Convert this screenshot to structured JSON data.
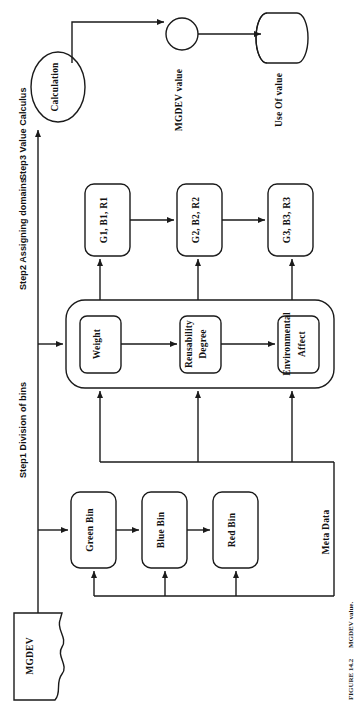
{
  "figure": {
    "caption": "FIGURE 14.2",
    "caption_detail": "MGDEV value.",
    "orientation": "rotated-90-ccw",
    "line_color": "#1a1a1a",
    "background_color": "#ffffff"
  },
  "steps": [
    {
      "id": "step1",
      "label": "Step1 Division of bins"
    },
    {
      "id": "step2",
      "label": "Step2 Assigning domains"
    },
    {
      "id": "step3",
      "label": "Step3 Value Calculus"
    }
  ],
  "nodes": {
    "source_document": {
      "label": "MGDEV",
      "shape": "document"
    },
    "bins": [
      {
        "id": "green-bin",
        "label": "Green   Bin",
        "shape": "rounded-rect"
      },
      {
        "id": "blue-bin",
        "label": "Blue Bin",
        "shape": "rounded-rect"
      },
      {
        "id": "red-bin",
        "label": "Red Bin",
        "shape": "rounded-rect"
      }
    ],
    "domains": [
      {
        "id": "weight",
        "label": "Weight",
        "shape": "rounded-rect",
        "lines": [
          "Weight"
        ]
      },
      {
        "id": "reusability-degree",
        "label": "Reusability Degree",
        "shape": "rounded-rect",
        "lines": [
          "Reusability",
          "Degree"
        ]
      },
      {
        "id": "environmental-affect",
        "label": "Environmental Affect",
        "shape": "rounded-rect",
        "lines": [
          "Environmental",
          "Affect"
        ]
      }
    ],
    "domain_group": {
      "id": "domain-group",
      "shape": "rounded-rect-container"
    },
    "values": [
      {
        "id": "value-1",
        "label": "G1, B1, R1",
        "shape": "rounded-rect"
      },
      {
        "id": "value-2",
        "label": "G2, B2, R2",
        "shape": "rounded-rect"
      },
      {
        "id": "value-3",
        "label": "G3, B3, R3",
        "shape": "rounded-rect"
      }
    ],
    "calculation": {
      "id": "calculation",
      "label": "Calculation",
      "shape": "ellipse"
    },
    "mgdev_value": {
      "id": "mgdev-value",
      "label": "MGDEV value",
      "shape": "circle"
    },
    "use_of_value": {
      "id": "use-of-value",
      "label": "Use Of value",
      "shape": "cylinder"
    }
  },
  "edge_labels": [
    {
      "id": "meta-data",
      "label": "Meta Data"
    }
  ]
}
